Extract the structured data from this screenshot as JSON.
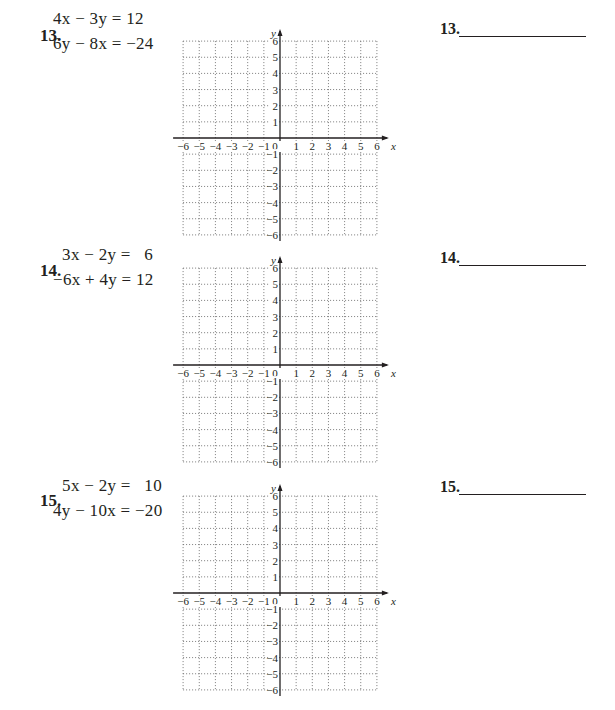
{
  "problems": [
    {
      "number": "13.",
      "equation_1": "4x − 3y = 12",
      "equation_2": "6y − 8x = −24",
      "answer_label": "13.",
      "answer_value": ""
    },
    {
      "number": "14.",
      "equation_1": "  3x − 2y =   6",
      "equation_2": "−6x + 4y = 12",
      "answer_label": "14.",
      "answer_value": ""
    },
    {
      "number": "15.",
      "equation_1": "  5x − 2y =   10",
      "equation_2": "4y − 10x = −20",
      "answer_label": "15.",
      "answer_value": ""
    }
  ],
  "graph": {
    "x_axis_label": "x",
    "y_axis_label": "y",
    "x_ticks": [
      "−6",
      "−5",
      "−4",
      "−3",
      "−2",
      "−1",
      "0",
      "1",
      "2",
      "3",
      "4",
      "5",
      "6"
    ],
    "y_ticks": [
      "6",
      "5",
      "4",
      "3",
      "2",
      "1",
      "−1",
      "−2",
      "−3",
      "−4",
      "−5",
      "−6"
    ],
    "range": [
      -6,
      6
    ],
    "grid_style": "dotted"
  },
  "colors": {
    "ink": "#231f20",
    "grid": "#6d6d6d",
    "background": "#ffffff"
  }
}
